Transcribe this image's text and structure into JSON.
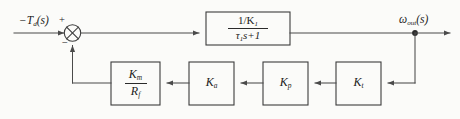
{
  "figure": {
    "type": "control-system-block-diagram",
    "background_color": "#fbfbf9",
    "line_color": "#4a4a4a",
    "text_color": "#1b1b1b"
  },
  "input": {
    "label_main": "−T",
    "label_sub": "d",
    "label_tail": "(s)"
  },
  "summing_junction": {
    "name": "summing-junction",
    "plus_sign": "+",
    "minus_sign": "−"
  },
  "forward_block": {
    "numerator_main": "1/K",
    "numerator_sub": "1",
    "denominator_tau": "τ",
    "denominator_sub": "1",
    "denominator_tail": "s+1"
  },
  "output": {
    "label_main": "ω",
    "label_sub": "out",
    "label_tail": "(s)"
  },
  "feedback_blocks": [
    {
      "name": "block-km-rf",
      "kind": "fraction",
      "numerator_main": "K",
      "numerator_sub": "m",
      "denominator_main": "R",
      "denominator_sub": "f"
    },
    {
      "name": "block-ka",
      "kind": "gain",
      "gain_main": "K",
      "gain_sub": "a"
    },
    {
      "name": "block-kp",
      "kind": "gain",
      "gain_main": "K",
      "gain_sub": "p"
    },
    {
      "name": "block-kt",
      "kind": "gain",
      "gain_main": "K",
      "gain_sub": "t"
    }
  ]
}
